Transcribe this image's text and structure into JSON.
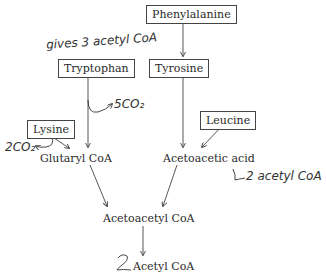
{
  "diagram": {
    "type": "metabolic-pathway",
    "nodes": {
      "phenylalanine": "Phenylalanine",
      "tryptophan": "Tryptophan",
      "tyrosine": "Tyrosine",
      "lysine": "Lysine",
      "leucine": "Leucine",
      "glutaryl_coa": "Glutaryl CoA",
      "acetoacetic_acid": "Acetoacetic acid",
      "acetoacetyl_coa": "Acetoacetyl CoA",
      "acetyl_coa": "Acetyl CoA"
    },
    "annotations": {
      "tryptophan_note": "gives 3 acetyl CoA",
      "tryptophan_co2": "5CO₂",
      "lysine_co2": "2CO₂",
      "acetoacetic_note": "2 acetyl CoA",
      "acetyl_prefix": "2"
    },
    "edges": [
      {
        "from": "Phenylalanine",
        "to": "Tyrosine"
      },
      {
        "from": "Tyrosine",
        "to": "Acetoacetic acid"
      },
      {
        "from": "Leucine",
        "to": "Acetoacetic acid"
      },
      {
        "from": "Tryptophan",
        "to": "Glutaryl CoA"
      },
      {
        "from": "Lysine",
        "to": "Glutaryl CoA"
      },
      {
        "from": "Glutaryl CoA",
        "to": "Acetoacetyl CoA"
      },
      {
        "from": "Acetoacetic acid",
        "to": "Acetoacetyl CoA"
      },
      {
        "from": "Acetoacetyl CoA",
        "to": "Acetyl CoA"
      }
    ]
  }
}
